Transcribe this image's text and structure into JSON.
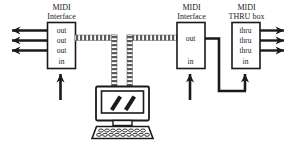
{
  "diagram": {
    "background_color": "#ffffff",
    "ink_color": "#1a1a1a",
    "cable_color": "#4d4d4d",
    "nodes": [
      {
        "id": "midi-interface-left",
        "title_line1": "MIDI",
        "title_line2": "Interface",
        "ports": [
          "out",
          "out",
          "out",
          "in"
        ]
      },
      {
        "id": "midi-interface-right",
        "title_line1": "MIDI",
        "title_line2": "Interface",
        "ports": [
          "out",
          "in"
        ]
      },
      {
        "id": "midi-thru-box",
        "title_line1": "MIDI",
        "title_line2": "THRU box",
        "ports": [
          "thru",
          "thru",
          "thru",
          "in"
        ]
      },
      {
        "id": "computer",
        "title_line1": "",
        "title_line2": "",
        "ports": []
      }
    ],
    "port_labels": {
      "left_interface": {
        "out1": "out",
        "out2": "out",
        "out3": "out",
        "in": "in"
      },
      "right_interface": {
        "out": "out",
        "in": "in"
      },
      "thru_box": {
        "thru1": "thru",
        "thru2": "thru",
        "thru3": "thru",
        "in": "in"
      }
    },
    "screen_glyph": "two-slash-marks"
  }
}
